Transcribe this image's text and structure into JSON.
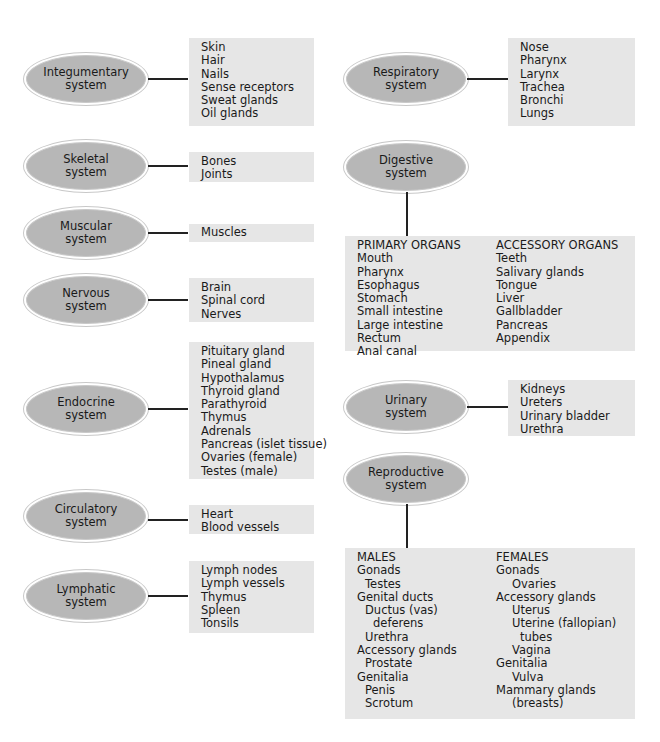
{
  "diagram": {
    "title": "",
    "systems_left": [
      {
        "name": "Integumentary",
        "suffix": "system",
        "organs": [
          "Skin",
          "Hair",
          "Nails",
          "Sense receptors",
          "Sweat glands",
          "Oil glands"
        ]
      },
      {
        "name": "Skeletal",
        "suffix": "system",
        "organs": [
          "Bones",
          "Joints"
        ]
      },
      {
        "name": "Muscular",
        "suffix": "system",
        "organs": [
          "Muscles"
        ]
      },
      {
        "name": "Nervous",
        "suffix": "system",
        "organs": [
          "Brain",
          "Spinal cord",
          "Nerves"
        ]
      },
      {
        "name": "Endocrine",
        "suffix": "system",
        "organs": [
          "Pituitary gland",
          "Pineal gland",
          "Hypothalamus",
          "Thyroid gland",
          "Parathyroid",
          "Thymus",
          "Adrenals",
          "Pancreas (islet tissue)",
          "Ovaries (female)",
          "Testes (male)"
        ]
      },
      {
        "name": "Circulatory",
        "suffix": "system",
        "organs": [
          "Heart",
          "Blood vessels"
        ]
      },
      {
        "name": "Lymphatic",
        "suffix": "system",
        "organs": [
          "Lymph nodes",
          "Lymph vessels",
          "Thymus",
          "Spleen",
          "Tonsils"
        ]
      }
    ],
    "systems_right": {
      "respiratory": {
        "name": "Respiratory",
        "suffix": "system",
        "organs": [
          "Nose",
          "Pharynx",
          "Larynx",
          "Trachea",
          "Bronchi",
          "Lungs"
        ]
      },
      "digestive": {
        "name": "Digestive",
        "suffix": "system",
        "primary": {
          "header": "PRIMARY ORGANS",
          "items": [
            "Mouth",
            "Pharynx",
            "Esophagus",
            "Stomach",
            "Small intestine",
            "Large intestine",
            "Rectum",
            "Anal canal"
          ]
        },
        "accessory": {
          "header": "ACCESSORY ORGANS",
          "items": [
            "Teeth",
            "Salivary glands",
            "Tongue",
            "Liver",
            "Gallbladder",
            "Pancreas",
            "Appendix"
          ]
        }
      },
      "urinary": {
        "name": "Urinary",
        "suffix": "system",
        "organs": [
          "Kidneys",
          "Ureters",
          "Urinary bladder",
          "Urethra"
        ]
      },
      "reproductive": {
        "name": "Reproductive",
        "suffix": "system",
        "males": {
          "header": "MALES",
          "items": [
            {
              "text": "Gonads",
              "level": 0
            },
            {
              "text": "Testes",
              "level": 1
            },
            {
              "text": "Genital ducts",
              "level": 0
            },
            {
              "text": "Ductus (vas)",
              "level": 1
            },
            {
              "text": "deferens",
              "level": 2
            },
            {
              "text": "Urethra",
              "level": 1
            },
            {
              "text": "Accessory glands",
              "level": 0
            },
            {
              "text": "Prostate",
              "level": 1
            },
            {
              "text": "Genitalia",
              "level": 0
            },
            {
              "text": "Penis",
              "level": 1
            },
            {
              "text": "Scrotum",
              "level": 1
            }
          ]
        },
        "females": {
          "header": "FEMALES",
          "items": [
            {
              "text": "Gonads",
              "level": 0
            },
            {
              "text": "Ovaries",
              "level": 2
            },
            {
              "text": "Accessory glands",
              "level": 0
            },
            {
              "text": "Uterus",
              "level": 2
            },
            {
              "text": "Uterine (fallopian)",
              "level": 2
            },
            {
              "text": "tubes",
              "level": 3
            },
            {
              "text": "Vagina",
              "level": 2
            },
            {
              "text": "Genitalia",
              "level": 0
            },
            {
              "text": "Vulva",
              "level": 2
            },
            {
              "text": "Mammary glands",
              "level": 0
            },
            {
              "text": "(breasts)",
              "level": 2
            }
          ]
        }
      }
    },
    "colors": {
      "oval_fill": "#b7b7b7",
      "box_fill": "#e6e6e6",
      "line": "#222222"
    }
  }
}
